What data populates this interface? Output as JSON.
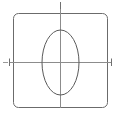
{
  "figure": {
    "canvas": {
      "width": 120,
      "height": 120,
      "background": "#ffffff"
    },
    "colors": {
      "square_stroke": "#6b6b6b",
      "ellipse_stroke": "#5a5a5a",
      "axis_stroke": "#8c8c8c",
      "tick_stroke": "#707070",
      "background": "#ffffff"
    },
    "shapes": {
      "square": {
        "name": "rounded-square",
        "x": 13,
        "y": 13,
        "width": 95,
        "height": 95,
        "corner_radius": 5,
        "stroke_width": 1,
        "fill": "none"
      },
      "ellipse": {
        "name": "vertical-ellipse",
        "center_x": 60.5,
        "center_y": 62.5,
        "radius_x": 18.5,
        "radius_y": 32.5,
        "stroke_width": 1,
        "fill": "none"
      },
      "horizontal_axis": {
        "name": "horizontal-axis-line",
        "x1": 9,
        "y1": 62.5,
        "x2": 112,
        "y2": 62.5,
        "stroke_width": 1
      },
      "vertical_axis": {
        "name": "vertical-axis-line",
        "x1": 60.5,
        "y1": 9,
        "x2": 60.5,
        "y2": 108,
        "stroke_width": 1
      }
    },
    "ticks": [
      {
        "name": "tick-top",
        "orientation": "vertical",
        "x1": 60.5,
        "y1": 2,
        "x2": 60.5,
        "y2": 9,
        "stroke_width": 1
      },
      {
        "name": "tick-left",
        "orientation": "vertical",
        "x1": 9.5,
        "y1": 58.5,
        "x2": 9.5,
        "y2": 66,
        "stroke_width": 1
      },
      {
        "name": "tick-right",
        "orientation": "vertical",
        "x1": 111.5,
        "y1": 58.5,
        "x2": 111.5,
        "y2": 66,
        "stroke_width": 1
      },
      {
        "name": "tick-left-stub",
        "orientation": "horizontal",
        "x1": 3,
        "y1": 62.5,
        "x2": 8,
        "y2": 62.5,
        "stroke_width": 1
      }
    ]
  }
}
